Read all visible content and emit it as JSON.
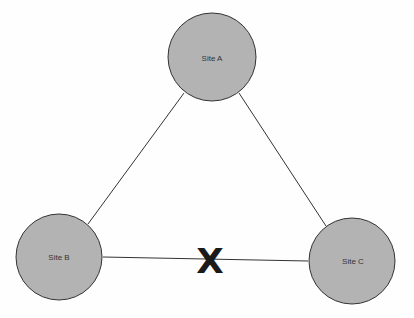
{
  "diagram": {
    "nodes": [
      {
        "id": "A",
        "label": "Site A",
        "cx": 212,
        "cy": 57,
        "r": 45
      },
      {
        "id": "B",
        "label": "Site B",
        "cx": 59,
        "cy": 257,
        "r": 44
      },
      {
        "id": "C",
        "label": "Site C",
        "cx": 352,
        "cy": 261,
        "r": 44
      }
    ],
    "edges": [
      {
        "from": "A",
        "to": "B",
        "status": "connected"
      },
      {
        "from": "A",
        "to": "C",
        "status": "connected"
      },
      {
        "from": "B",
        "to": "C",
        "status": "broken"
      }
    ],
    "break_marker": "X",
    "colors": {
      "node_fill": "#b3b3b3",
      "node_stroke": "#333333",
      "edge": "#333333"
    }
  }
}
